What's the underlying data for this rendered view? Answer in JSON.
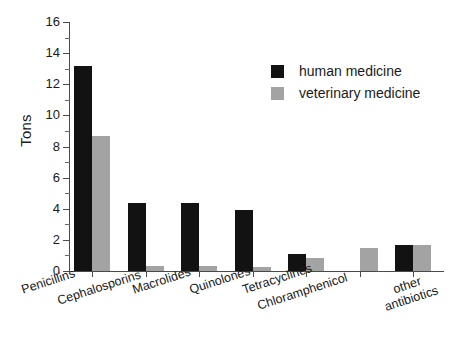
{
  "chart_data": {
    "type": "bar",
    "title": "",
    "xlabel": "",
    "ylabel": "Tons",
    "ylim": [
      0,
      16
    ],
    "ytick_step": 2,
    "yticks": [
      0,
      2,
      4,
      6,
      8,
      10,
      12,
      14,
      16
    ],
    "ytick_labels": [
      "0",
      "2",
      "4",
      "6",
      "8",
      "10",
      "12",
      "14",
      "16"
    ],
    "grid": false,
    "legend_position": "top-right",
    "categories": [
      "Penicillins",
      "Cephalosporins",
      "Macrolides",
      "Quinolones",
      "Tetracyclines",
      "Chloramphenicol",
      "other antibiotics"
    ],
    "series": [
      {
        "name": "human medicine",
        "color": "#121212",
        "values": [
          13.2,
          4.35,
          4.35,
          3.9,
          1.1,
          0.0,
          1.65
        ]
      },
      {
        "name": "veterinary medicine",
        "color": "#a3a3a3",
        "values": [
          8.7,
          0.3,
          0.3,
          0.25,
          0.85,
          1.5,
          1.65
        ]
      }
    ]
  },
  "legend": {
    "items": [
      {
        "label": "human medicine",
        "color": "#121212"
      },
      {
        "label": "veterinary medicine",
        "color": "#a3a3a3"
      }
    ]
  },
  "axes": {
    "y_title": "Tons"
  }
}
